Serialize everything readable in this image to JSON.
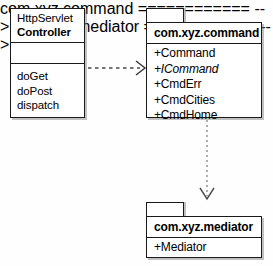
{
  "diagram": {
    "type": "uml-class-package-diagram",
    "background_color": "#fefefe",
    "stroke_color": "#1a1a1a"
  },
  "controller_class": {
    "stereotype_line": "HttpServlet",
    "name": "Controller",
    "attributes": [],
    "operations": [
      "doGet",
      "doPost",
      "dispatch"
    ]
  },
  "command_package": {
    "name": "com.xyz.command",
    "members": [
      {
        "text": "+Command",
        "italic": false
      },
      {
        "text": "+ICommand",
        "italic": true
      },
      {
        "text": "+CmdErr",
        "italic": false
      },
      {
        "text": "+CmdCities",
        "italic": false
      },
      {
        "text": "+CmdHome",
        "italic": false
      }
    ]
  },
  "mediator_package": {
    "name": "com.xyz.mediator",
    "members": [
      {
        "text": "+Mediator",
        "italic": false
      }
    ]
  },
  "connectors": [
    {
      "id": "controller-to-command",
      "kind": "dependency",
      "line_style": "dashed",
      "arrow_head": "open",
      "label": ""
    },
    {
      "id": "command-to-mediator",
      "kind": "dependency",
      "line_style": "dotted",
      "arrow_head": "open",
      "label": ""
    }
  ]
}
